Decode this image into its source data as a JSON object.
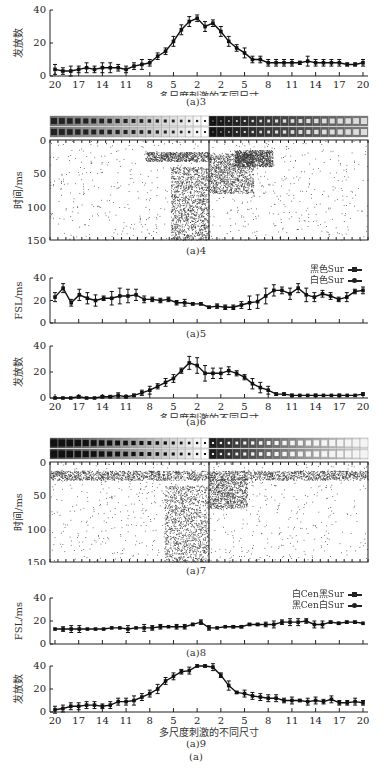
{
  "figure_caption": "(a)",
  "x_tick_labels": [
    "20",
    "17",
    "14",
    "11",
    "8",
    "5",
    "2",
    "2",
    "5",
    "8",
    "11",
    "14",
    "17",
    "20"
  ],
  "x_axis_label": "多尺度刺激的不同尺寸",
  "chart_data": [
    {
      "id": "a3",
      "type": "line",
      "caption": "(a)3",
      "ylabel": "发放数",
      "xlabel": "多尺度刺激的不同尺寸",
      "ylim": [
        0,
        40
      ],
      "yticks": [
        0,
        20,
        40
      ],
      "x_tick_labels": [
        "20",
        "17",
        "14",
        "11",
        "8",
        "5",
        "2",
        "2",
        "5",
        "8",
        "11",
        "14",
        "17",
        "20"
      ],
      "values": [
        4,
        3,
        3,
        4,
        5,
        4,
        5,
        5,
        5,
        4,
        6,
        7,
        8,
        12,
        15,
        21,
        28,
        33,
        35,
        30,
        32,
        27,
        21,
        17,
        14,
        10,
        10,
        8,
        8,
        8,
        8,
        8,
        9,
        8,
        8,
        8,
        8,
        7,
        7,
        8
      ],
      "errors": [
        3,
        2,
        3,
        2,
        3,
        2,
        3,
        3,
        2,
        2,
        2,
        3,
        2,
        2,
        2,
        3,
        3,
        3,
        2,
        3,
        2,
        3,
        3,
        2,
        3,
        2,
        2,
        2,
        2,
        2,
        2,
        1,
        3,
        2,
        2,
        2,
        2,
        1,
        1,
        2
      ]
    },
    {
      "id": "a4",
      "type": "raster",
      "caption": "(a)4",
      "ylabel": "时间/ms",
      "ylim": [
        0,
        150
      ],
      "yticks": [
        0,
        50,
        100,
        150
      ],
      "description": "Spike raster; dense responses 20-40 ms near center sizes, scattered spikes 40-150 ms on left-center"
    },
    {
      "id": "a5",
      "type": "line",
      "caption": "(a)5",
      "ylabel": "FSL/ms",
      "ylim": [
        0,
        40
      ],
      "yticks": [
        0,
        20,
        40
      ],
      "legend": [
        "黑色Sur",
        "白色Sur"
      ],
      "values": [
        23,
        31,
        18,
        25,
        22,
        20,
        22,
        22,
        24,
        24,
        25,
        21,
        21,
        20,
        21,
        18,
        18,
        17,
        17,
        14,
        15,
        14,
        14,
        16,
        18,
        19,
        24,
        29,
        29,
        26,
        31,
        25,
        23,
        26,
        24,
        21,
        23,
        28,
        29
      ],
      "errors": [
        4,
        4,
        3,
        5,
        5,
        5,
        2,
        6,
        7,
        6,
        5,
        3,
        2,
        2,
        2,
        2,
        3,
        1,
        1,
        1,
        2,
        2,
        2,
        3,
        6,
        6,
        7,
        5,
        3,
        5,
        4,
        6,
        4,
        3,
        3,
        2,
        4,
        2,
        3
      ]
    },
    {
      "id": "a6",
      "type": "line",
      "caption": "(a)6",
      "ylabel": "发放数",
      "xlabel": "多尺度刺激的不同尺寸",
      "ylim": [
        0,
        40
      ],
      "yticks": [
        0,
        20,
        40
      ],
      "x_tick_labels": [
        "20",
        "17",
        "14",
        "11",
        "8",
        "5",
        "2",
        "2",
        "5",
        "8",
        "11",
        "14",
        "17",
        "20"
      ],
      "values": [
        0,
        0,
        0,
        1,
        0,
        0,
        1,
        1,
        2,
        1,
        2,
        4,
        6,
        9,
        12,
        15,
        21,
        27,
        25,
        19,
        19,
        19,
        21,
        19,
        16,
        11,
        8,
        6,
        3,
        3,
        2,
        2,
        2,
        2,
        2,
        2,
        2,
        2,
        2,
        3
      ],
      "errors": [
        0,
        0,
        0,
        1,
        0,
        0,
        1,
        1,
        2,
        1,
        1,
        2,
        3,
        2,
        3,
        3,
        2,
        5,
        6,
        6,
        4,
        4,
        3,
        2,
        2,
        4,
        4,
        3,
        1,
        1,
        1,
        0,
        0,
        1,
        0,
        0,
        1,
        0,
        0,
        1
      ]
    },
    {
      "id": "a7",
      "type": "raster",
      "caption": "(a)7",
      "ylabel": "时间/ms",
      "ylim": [
        0,
        150
      ],
      "yticks": [
        0,
        50,
        100,
        150
      ],
      "description": "Spike raster; dense band 15-30 ms across all sizes, scattered spikes 40-150 ms around center"
    },
    {
      "id": "a8",
      "type": "line",
      "caption": "(a)8",
      "ylabel": "FSL/ms",
      "ylim": [
        0,
        40
      ],
      "yticks": [
        0,
        20,
        40
      ],
      "legend": [
        "白Cen黑Sur",
        "黑Cen白Sur"
      ],
      "values": [
        13,
        13,
        13,
        13,
        13,
        13,
        13,
        14,
        14,
        13,
        14,
        14,
        14,
        15,
        15,
        15,
        15,
        17,
        19,
        14,
        14,
        15,
        15,
        15,
        17,
        17,
        17,
        17,
        19,
        19,
        19,
        20,
        17,
        17,
        19,
        18,
        19,
        19,
        18
      ],
      "errors": [
        0,
        2,
        3,
        3,
        0,
        0,
        0,
        0,
        0,
        3,
        0,
        3,
        2,
        2,
        0,
        2,
        2,
        1,
        2,
        2,
        0,
        0,
        1,
        1,
        1,
        1,
        2,
        3,
        2,
        3,
        3,
        2,
        3,
        3,
        1,
        1,
        1,
        1,
        0
      ]
    },
    {
      "id": "a9",
      "type": "line",
      "caption": "(a)9",
      "ylabel": "发放数",
      "xlabel": "多尺度刺激的不同尺寸",
      "ylim": [
        0,
        40
      ],
      "yticks": [
        0,
        20,
        40
      ],
      "x_tick_labels": [
        "20",
        "17",
        "14",
        "11",
        "8",
        "5",
        "2",
        "2",
        "5",
        "8",
        "11",
        "14",
        "17",
        "20"
      ],
      "values": [
        2,
        3,
        5,
        5,
        6,
        6,
        5,
        6,
        9,
        9,
        10,
        13,
        16,
        20,
        27,
        31,
        35,
        36,
        40,
        40,
        39,
        32,
        23,
        17,
        16,
        14,
        13,
        12,
        12,
        10,
        10,
        10,
        9,
        10,
        9,
        11,
        8,
        8,
        9,
        8
      ],
      "errors": [
        3,
        3,
        3,
        3,
        3,
        3,
        2,
        3,
        3,
        3,
        4,
        3,
        3,
        4,
        3,
        3,
        2,
        3,
        1,
        1,
        3,
        2,
        4,
        1,
        3,
        3,
        3,
        3,
        3,
        2,
        3,
        1,
        3,
        3,
        2,
        3,
        2,
        2,
        3,
        2
      ]
    }
  ]
}
